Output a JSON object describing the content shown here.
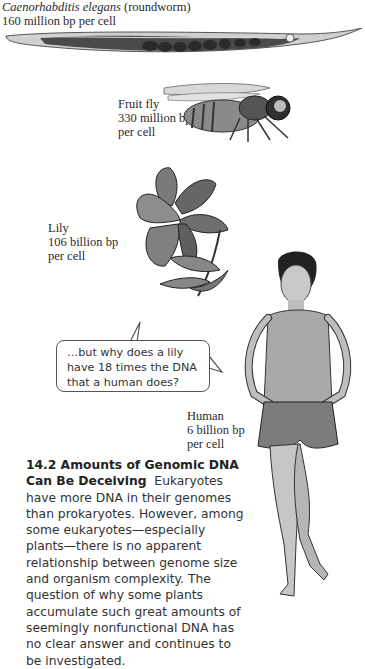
{
  "organisms": [
    {
      "id": "roundworm",
      "name_italic": "Caenorhabditis elegans",
      "name_suffix": " (roundworm)",
      "genome": "160 million bp per cell"
    },
    {
      "id": "fruit-fly",
      "name": "Fruit fly",
      "genome_line1": "330 million bp",
      "genome_line2": "per cell"
    },
    {
      "id": "lily",
      "name": "Lily",
      "genome_line1": "106 billion bp",
      "genome_line2": "per cell"
    },
    {
      "id": "human",
      "name": "Human",
      "genome_line1": "6 billion bp",
      "genome_line2": "per cell"
    }
  ],
  "speech_bubble": {
    "line1": "…but why does a lily",
    "line2": "have 18 times the DNA",
    "line3": "that a human does?"
  },
  "caption": {
    "title": "14.2 Amounts of Genomic DNA Can Be Deceiving",
    "body": "Eukaryotes have more DNA in their genomes than prokaryotes. However, among some eukaryotes—especially plants—there is no apparent relationship between genome size and organism complexity. The question of why some plants accumulate such great amounts of seemingly nonfunctional DNA has no clear answer and continues to be investigated."
  }
}
